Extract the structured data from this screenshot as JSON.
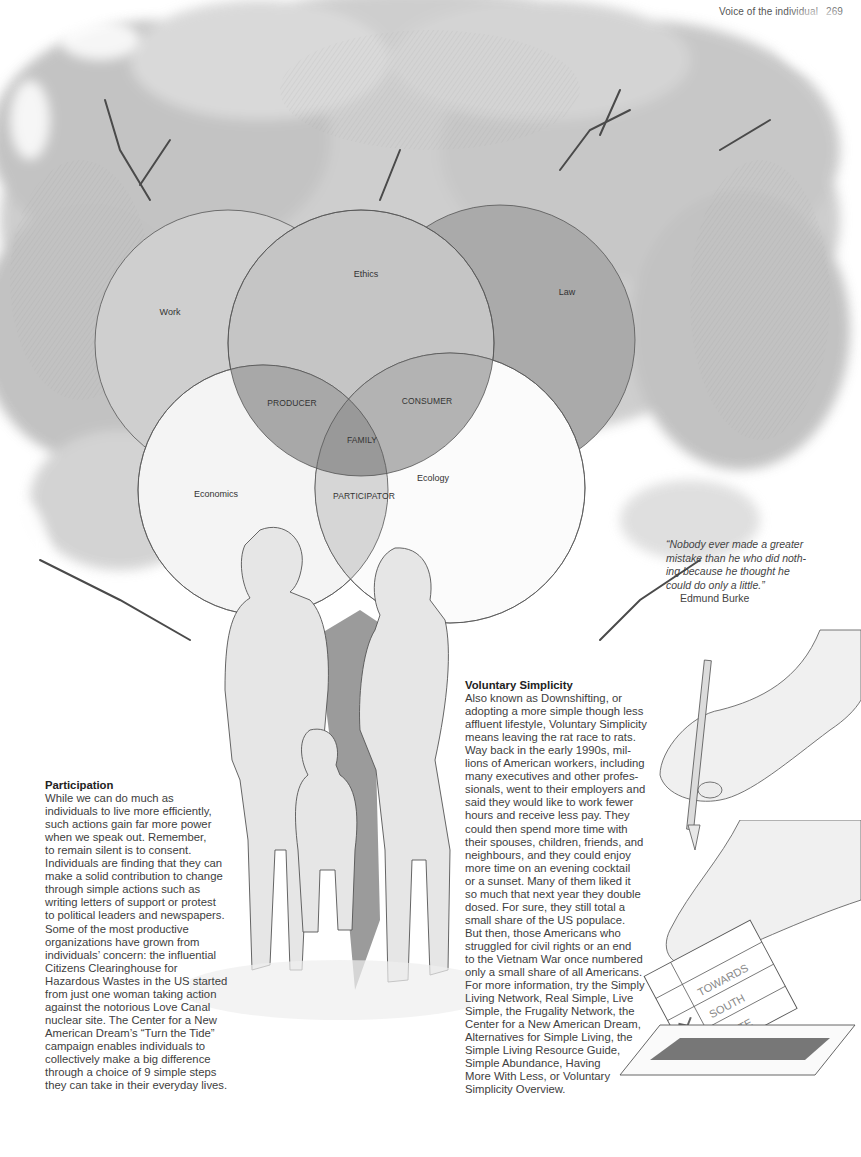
{
  "running_head": {
    "section": "Voice of the individual",
    "page_number": "269"
  },
  "illustration": {
    "canopy_icon": "tree-canopy-illustration",
    "figures_icon": "family-silhouettes",
    "pencil_icon": "hand-holding-pencil",
    "ballot_icon": "hand-casting-ballot"
  },
  "venn_diagram": {
    "circles": [
      {
        "label": "Work",
        "fill": "#cfcfcf"
      },
      {
        "label": "Ethics",
        "fill": "#c4c4c4"
      },
      {
        "label": "Law",
        "fill": "#a9a9a9"
      },
      {
        "label": "Economics",
        "fill": "#f4f4f4"
      },
      {
        "label": "Ecology",
        "fill": "#fafafa"
      }
    ],
    "intersections": {
      "producer": "PRODUCER",
      "consumer": "CONSUMER",
      "family": "FAMILY",
      "participator": "PARTICIPATOR"
    }
  },
  "ballot": {
    "lines": [
      "TOWARDS",
      "SOUTH",
      "QUITE"
    ]
  },
  "quote": {
    "text": "“Nobody ever made a greater mistake than he who did nothing because he thought he could do only a little.”",
    "lines": [
      "“Nobody ever made a greater",
      "mistake than he who did noth-",
      "ing because he thought he",
      "could do only a little.”"
    ],
    "author": "Edmund Burke"
  },
  "participation": {
    "heading": "Participation",
    "lines": [
      "While we can do much as",
      "individuals to live more efficiently,",
      "such actions gain far more power",
      "when we speak out. Remember,",
      "to remain silent is to consent.",
      "Individuals are finding that they can",
      "make a solid contribution to change",
      "through simple actions such as",
      "writing letters of support or protest",
      "to political leaders and newspapers.",
      "Some of the most productive",
      "organizations have grown from",
      "individuals’ concern: the influential",
      "Citizens Clearinghouse for",
      "Hazardous Wastes in the US started",
      "from just one woman taking action",
      "against the notorious Love Canal",
      "nuclear site. The Center for a New",
      "American Dream’s “Turn the Tide”",
      "campaign enables individuals to",
      "collectively make a big difference",
      "through a choice of 9 simple steps",
      "they can take in their everyday lives."
    ]
  },
  "voluntary_simplicity": {
    "heading": "Voluntary Simplicity",
    "lines": [
      "Also known as Downshifting, or",
      "adopting a more simple though less",
      "affluent lifestyle, Voluntary Simplicity",
      "means leaving the rat race to rats.",
      "Way back in the early 1990s, mil-",
      "lions of American workers, including",
      "many executives and other profes-",
      "sionals, went to their employers and",
      "said they would like to work fewer",
      "hours and receive less pay. They",
      "could then spend more time with",
      "their spouses, children, friends, and",
      "neighbours, and they could enjoy",
      "more time on an evening cocktail",
      "or a sunset. Many of them liked it",
      "so much that next year they double",
      "dosed. For sure, they still total a",
      "small share of the US populace.",
      "But then, those Americans who",
      "struggled for civil rights or an end",
      "to the Vietnam War once numbered",
      "only a small share of all Americans.",
      "For more information, try the Simply",
      "Living Network, Real Simple, Live",
      "Simple, the Frugality Network, the",
      "Center for a New American Dream,",
      "Alternatives for Simple Living, the",
      "Simple Living Resource Guide,",
      "Simple Abundance, Having",
      "More With Less, or Voluntary",
      "Simplicity Overview."
    ]
  }
}
